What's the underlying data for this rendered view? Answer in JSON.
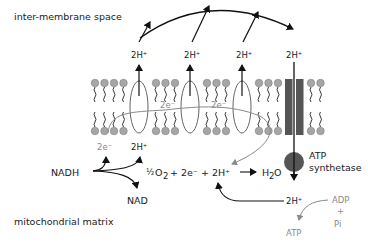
{
  "regions": {
    "intermembrane": "inter-membrane space",
    "matrix": "mitochondrial matrix"
  },
  "protons": {
    "pumped": [
      "2H⁺",
      "2H⁺",
      "2H⁺"
    ],
    "synthase_in": "2H⁺",
    "synthase_out": "2H⁺",
    "nadh_proton": "2H⁺"
  },
  "electrons": {
    "nadh_electron": "2e⁻",
    "transfer_1": "2e⁻",
    "transfer_2": "2e⁻"
  },
  "reactions": {
    "nadh": "NADH",
    "nad": "NAD",
    "half": "½",
    "oxygen": "O",
    "oxygen_sub": "2",
    "plus_2e": "+ 2e⁻ + 2H⁺",
    "water_h": "H",
    "water_sub": "2",
    "water_o": "O"
  },
  "atp": {
    "synthetase_line1": "ATP",
    "synthetase_line2": "synthetase",
    "adp": "ADP",
    "plus": "+",
    "pi": "Pi",
    "atp_product": "ATP"
  },
  "colors": {
    "lipid_head": "#a6a6a6",
    "synthase": "#555555",
    "grey_text": "#8a8a8a"
  }
}
